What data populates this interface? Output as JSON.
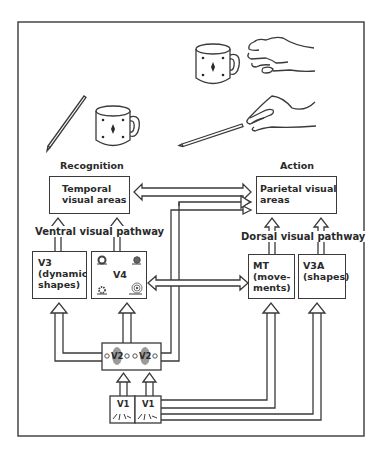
{
  "figure": {
    "illustrations": {
      "recognition_objects": [
        "pencil",
        "mug"
      ],
      "action_objects": [
        "hand-grasping-mug",
        "hand-grasping-pencil"
      ]
    },
    "headers": {
      "recognition": "Recognition",
      "action": "Action"
    },
    "pathways": {
      "ventral": "Ventral visual pathway",
      "dorsal": "Dorsal visual pathway"
    },
    "boxes": {
      "temporal": "Temporal\nvisual areas",
      "parietal": "Parietal visual\nareas",
      "v3": "V3\n(dynamic\nshapes)",
      "v4": "V4",
      "mt": "MT\n(move-\nments)",
      "v3a": "V3A\n(shapes)",
      "v2_left": "V2",
      "v2_right": "V2",
      "v1_left": "V1",
      "v1_right": "V1"
    },
    "colors": {
      "stroke": "#3a3a3a",
      "background": "#ffffff",
      "text": "#2a2a2a",
      "v2_blob": "#8a8a8a"
    }
  }
}
